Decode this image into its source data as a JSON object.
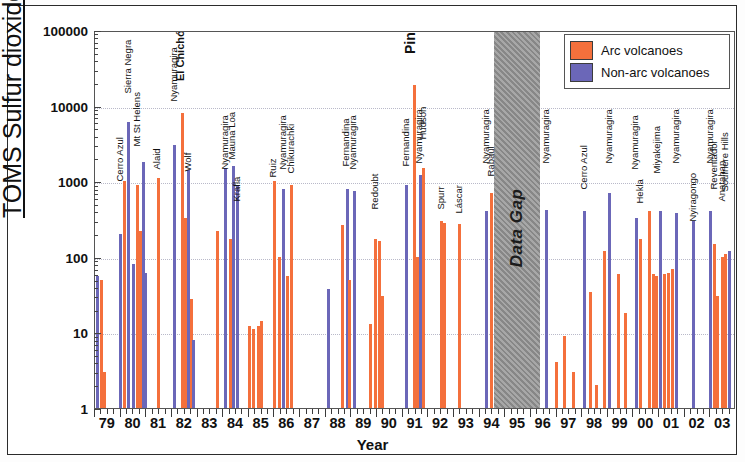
{
  "chart_data": {
    "type": "bar",
    "title": "",
    "xlabel": "Year",
    "ylabel": "TOMS Sulfur dioxide (kt)",
    "yscale": "log",
    "ylim": [
      1,
      100000
    ],
    "ytick_labels": [
      "1",
      "10",
      "100",
      "1000",
      "10000",
      "100000"
    ],
    "ytick_values": [
      1,
      10,
      100,
      1000,
      10000,
      100000
    ],
    "xlim": [
      1979,
      2004
    ],
    "xtick_labels": [
      "79",
      "80",
      "81",
      "82",
      "83",
      "84",
      "85",
      "86",
      "87",
      "88",
      "89",
      "90",
      "91",
      "92",
      "93",
      "94",
      "95",
      "96",
      "97",
      "98",
      "99",
      "00",
      "01",
      "02",
      "03"
    ],
    "grid": "horizontal-dotted",
    "legend_position": "top-right",
    "legend": [
      {
        "name": "Arc volcanoes",
        "color": "#f4703c"
      },
      {
        "name": "Non-arc volcanoes",
        "color": "#6b67b8"
      }
    ],
    "annotations": [
      {
        "text": "Data Gap",
        "x_start": 1994.55,
        "x_end": 1996.35,
        "style": "gray-band"
      }
    ],
    "series": [
      {
        "name": "Arc volcanoes",
        "color": "#f4703c"
      },
      {
        "name": "Non-arc volcanoes",
        "color": "#6b67b8"
      }
    ],
    "points": [
      {
        "x": 1979.05,
        "value": 55,
        "type": "nonarc",
        "label": ""
      },
      {
        "x": 1979.18,
        "value": 50,
        "type": "arc",
        "label": ""
      },
      {
        "x": 1979.3,
        "value": 3,
        "type": "arc",
        "label": ""
      },
      {
        "x": 1979.95,
        "value": 200,
        "type": "nonarc",
        "label": "Cerro Azul"
      },
      {
        "x": 1980.1,
        "value": 1000,
        "type": "arc",
        "label": ""
      },
      {
        "x": 1980.25,
        "value": 6000,
        "type": "nonarc",
        "label": "Sierra Negra"
      },
      {
        "x": 1980.45,
        "value": 80,
        "type": "nonarc",
        "label": ""
      },
      {
        "x": 1980.6,
        "value": 900,
        "type": "arc",
        "label": "Mt St Helens"
      },
      {
        "x": 1980.72,
        "value": 220,
        "type": "arc",
        "label": ""
      },
      {
        "x": 1980.83,
        "value": 1800,
        "type": "nonarc",
        "label": ""
      },
      {
        "x": 1980.93,
        "value": 62,
        "type": "nonarc",
        "label": ""
      },
      {
        "x": 1981.4,
        "value": 1100,
        "type": "arc",
        "label": "Alaid"
      },
      {
        "x": 1982.05,
        "value": 3000,
        "type": "nonarc",
        "label": "Nyamuragira"
      },
      {
        "x": 1982.35,
        "value": 8000,
        "type": "arc",
        "label": "El Chichón"
      },
      {
        "x": 1982.48,
        "value": 330,
        "type": "arc",
        "label": ""
      },
      {
        "x": 1982.57,
        "value": 1400,
        "type": "nonarc",
        "label": "Wolf"
      },
      {
        "x": 1982.7,
        "value": 28,
        "type": "arc",
        "label": ""
      },
      {
        "x": 1982.8,
        "value": 8,
        "type": "nonarc",
        "label": ""
      },
      {
        "x": 1983.7,
        "value": 220,
        "type": "arc",
        "label": ""
      },
      {
        "x": 1984.05,
        "value": 1500,
        "type": "nonarc",
        "label": "Nyamuragira"
      },
      {
        "x": 1984.22,
        "value": 170,
        "type": "arc",
        "label": ""
      },
      {
        "x": 1984.33,
        "value": 1600,
        "type": "nonarc",
        "label": "Mauna Loa"
      },
      {
        "x": 1984.5,
        "value": 900,
        "type": "nonarc",
        "label": "Krafla"
      },
      {
        "x": 1984.95,
        "value": 12,
        "type": "arc",
        "label": ""
      },
      {
        "x": 1985.12,
        "value": 11,
        "type": "arc",
        "label": ""
      },
      {
        "x": 1985.3,
        "value": 12,
        "type": "arc",
        "label": ""
      },
      {
        "x": 1985.44,
        "value": 14,
        "type": "arc",
        "label": ""
      },
      {
        "x": 1985.93,
        "value": 1000,
        "type": "arc",
        "label": "Ruiz"
      },
      {
        "x": 1986.13,
        "value": 100,
        "type": "arc",
        "label": ""
      },
      {
        "x": 1986.3,
        "value": 800,
        "type": "nonarc",
        "label": "Nyamuragira"
      },
      {
        "x": 1986.45,
        "value": 55,
        "type": "arc",
        "label": ""
      },
      {
        "x": 1986.6,
        "value": 900,
        "type": "arc",
        "label": "Chikurachki"
      },
      {
        "x": 1988.05,
        "value": 37,
        "type": "nonarc",
        "label": ""
      },
      {
        "x": 1988.6,
        "value": 260,
        "type": "arc",
        "label": ""
      },
      {
        "x": 1988.78,
        "value": 800,
        "type": "nonarc",
        "label": "Fernandina"
      },
      {
        "x": 1988.88,
        "value": 50,
        "type": "arc",
        "label": ""
      },
      {
        "x": 1989.05,
        "value": 750,
        "type": "nonarc",
        "label": "Nyamuragira"
      },
      {
        "x": 1989.7,
        "value": 13,
        "type": "arc",
        "label": ""
      },
      {
        "x": 1989.9,
        "value": 170,
        "type": "arc",
        "label": "Redoubt"
      },
      {
        "x": 1990.02,
        "value": 160,
        "type": "arc",
        "label": ""
      },
      {
        "x": 1990.14,
        "value": 30,
        "type": "arc",
        "label": ""
      },
      {
        "x": 1991.1,
        "value": 900,
        "type": "nonarc",
        "label": "Fernandina"
      },
      {
        "x": 1991.4,
        "value": 19000,
        "type": "arc",
        "label": "Pinatubo"
      },
      {
        "x": 1991.52,
        "value": 100,
        "type": "arc",
        "label": ""
      },
      {
        "x": 1991.62,
        "value": 1200,
        "type": "nonarc",
        "label": "Nyamuragira"
      },
      {
        "x": 1991.75,
        "value": 1500,
        "type": "arc",
        "label": "Hudson"
      },
      {
        "x": 1992.45,
        "value": 300,
        "type": "arc",
        "label": "Spurr"
      },
      {
        "x": 1992.58,
        "value": 280,
        "type": "arc",
        "label": ""
      },
      {
        "x": 1993.15,
        "value": 270,
        "type": "arc",
        "label": "Láscar"
      },
      {
        "x": 1994.22,
        "value": 400,
        "type": "nonarc",
        "label": "Nyamuragira"
      },
      {
        "x": 1994.4,
        "value": 700,
        "type": "arc",
        "label": "Rabaul"
      },
      {
        "x": 1996.55,
        "value": 420,
        "type": "nonarc",
        "label": "Nyamuragira"
      },
      {
        "x": 1996.95,
        "value": 4,
        "type": "arc",
        "label": ""
      },
      {
        "x": 1997.25,
        "value": 9,
        "type": "arc",
        "label": ""
      },
      {
        "x": 1997.62,
        "value": 3,
        "type": "arc",
        "label": ""
      },
      {
        "x": 1998.05,
        "value": 400,
        "type": "nonarc",
        "label": "Cerro Azul"
      },
      {
        "x": 1998.28,
        "value": 34,
        "type": "arc",
        "label": ""
      },
      {
        "x": 1998.5,
        "value": 2,
        "type": "arc",
        "label": ""
      },
      {
        "x": 1998.8,
        "value": 120,
        "type": "arc",
        "label": ""
      },
      {
        "x": 1999.0,
        "value": 700,
        "type": "nonarc",
        "label": "Nyamuragira"
      },
      {
        "x": 1999.35,
        "value": 60,
        "type": "arc",
        "label": ""
      },
      {
        "x": 1999.65,
        "value": 18,
        "type": "arc",
        "label": ""
      },
      {
        "x": 2000.05,
        "value": 330,
        "type": "nonarc",
        "label": "Nyamuragira"
      },
      {
        "x": 2000.22,
        "value": 170,
        "type": "arc",
        "label": "Hekla"
      },
      {
        "x": 2000.55,
        "value": 400,
        "type": "arc",
        "label": ""
      },
      {
        "x": 2000.72,
        "value": 60,
        "type": "arc",
        "label": ""
      },
      {
        "x": 2000.85,
        "value": 55,
        "type": "arc",
        "label": "Miyakejima"
      },
      {
        "x": 2001.0,
        "value": 400,
        "type": "nonarc",
        "label": ""
      },
      {
        "x": 2001.15,
        "value": 60,
        "type": "arc",
        "label": ""
      },
      {
        "x": 2001.3,
        "value": 62,
        "type": "arc",
        "label": ""
      },
      {
        "x": 2001.45,
        "value": 70,
        "type": "arc",
        "label": ""
      },
      {
        "x": 2001.62,
        "value": 380,
        "type": "nonarc",
        "label": "Nyamuragira"
      },
      {
        "x": 2002.3,
        "value": 300,
        "type": "nonarc",
        "label": "Nyiragongo"
      },
      {
        "x": 2002.95,
        "value": 400,
        "type": "nonarc",
        "label": "Nyamuragira"
      },
      {
        "x": 2003.1,
        "value": 150,
        "type": "arc",
        "label": "Reventador"
      },
      {
        "x": 2003.22,
        "value": 30,
        "type": "arc",
        "label": ""
      },
      {
        "x": 2003.4,
        "value": 100,
        "type": "arc",
        "label": "Anatahan"
      },
      {
        "x": 2003.55,
        "value": 110,
        "type": "arc",
        "label": "Soufriere Hills"
      },
      {
        "x": 2003.7,
        "value": 120,
        "type": "nonarc",
        "label": ""
      }
    ],
    "callout_labels": [
      {
        "text": "Cerro Azul",
        "x": 1979.95,
        "top": 140,
        "size": "small"
      },
      {
        "text": "Sierra Negra",
        "x": 1980.25,
        "top": 52,
        "size": "small"
      },
      {
        "text": "Mt St Helens",
        "x": 1980.6,
        "top": 105,
        "size": "small"
      },
      {
        "text": "Alaid",
        "x": 1981.4,
        "top": 128,
        "size": "small"
      },
      {
        "text": "Nyamuragira",
        "x": 1982.05,
        "top": 60,
        "size": "small"
      },
      {
        "text": "El Chichón",
        "x": 1982.38,
        "top": 38,
        "size": "med"
      },
      {
        "text": "Wolf",
        "x": 1982.6,
        "top": 130,
        "size": "small"
      },
      {
        "text": "Nyamuragira",
        "x": 1984.05,
        "top": 128,
        "size": "small"
      },
      {
        "text": "Mauna Loa",
        "x": 1984.33,
        "top": 118,
        "size": "small"
      },
      {
        "text": "Krafla",
        "x": 1984.52,
        "top": 160,
        "size": "small"
      },
      {
        "text": "Ruiz",
        "x": 1985.93,
        "top": 136,
        "size": "small"
      },
      {
        "text": "Nyamuragira",
        "x": 1986.3,
        "top": 128,
        "size": "small"
      },
      {
        "text": "Chikurachki",
        "x": 1986.62,
        "top": 132,
        "size": "small"
      },
      {
        "text": "Fernandina",
        "x": 1988.78,
        "top": 125,
        "size": "small"
      },
      {
        "text": "Nyamuragira",
        "x": 1989.05,
        "top": 128,
        "size": "small"
      },
      {
        "text": "Redoubt",
        "x": 1989.9,
        "top": 168,
        "size": "small"
      },
      {
        "text": "Fernandina",
        "x": 1991.1,
        "top": 125,
        "size": "small"
      },
      {
        "text": "Pinatubo",
        "x": 1991.38,
        "top": 8,
        "size": "big"
      },
      {
        "text": "Nyamuragira",
        "x": 1991.62,
        "top": 122,
        "size": "small"
      },
      {
        "text": "Hudson",
        "x": 1991.78,
        "top": 98,
        "size": "small"
      },
      {
        "text": "Spurr",
        "x": 1992.46,
        "top": 168,
        "size": "small"
      },
      {
        "text": "Láscar",
        "x": 1993.17,
        "top": 172,
        "size": "small"
      },
      {
        "text": "Nyamuragira",
        "x": 1994.22,
        "top": 122,
        "size": "small"
      },
      {
        "text": "Rabaul",
        "x": 1994.42,
        "top": 135,
        "size": "small"
      },
      {
        "text": "Nyamuragira",
        "x": 1996.57,
        "top": 122,
        "size": "small"
      },
      {
        "text": "Cerro Azul",
        "x": 1998.05,
        "top": 148,
        "size": "small"
      },
      {
        "text": "Nyamuragira",
        "x": 1999.02,
        "top": 122,
        "size": "small"
      },
      {
        "text": "Nyamuragira",
        "x": 2000.05,
        "top": 128,
        "size": "small"
      },
      {
        "text": "Hekla",
        "x": 2000.24,
        "top": 162,
        "size": "small"
      },
      {
        "text": "Miyakejima",
        "x": 2000.88,
        "top": 132,
        "size": "small"
      },
      {
        "text": "Nyamuragira",
        "x": 2001.64,
        "top": 122,
        "size": "small"
      },
      {
        "text": "Nyiragongo",
        "x": 2002.32,
        "top": 180,
        "size": "small"
      },
      {
        "text": "Nyamuragira",
        "x": 2002.97,
        "top": 122,
        "size": "small"
      },
      {
        "text": "Reventador",
        "x": 2003.12,
        "top": 148,
        "size": "small"
      },
      {
        "text": "Anatahan",
        "x": 2003.42,
        "top": 160,
        "size": "small"
      },
      {
        "text": "Soufriere Hills",
        "x": 2003.57,
        "top": 150,
        "size": "small"
      }
    ]
  }
}
